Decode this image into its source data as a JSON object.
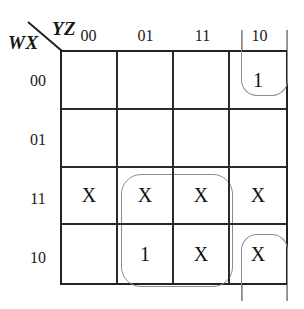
{
  "kmap": {
    "row_variable_label": "WX",
    "col_variable_label": "YZ",
    "col_headers": [
      "00",
      "01",
      "11",
      "10"
    ],
    "row_headers": [
      "00",
      "01",
      "11",
      "10"
    ],
    "cells": [
      [
        "",
        "",
        "",
        "1"
      ],
      [
        "",
        "",
        "",
        ""
      ],
      [
        "X",
        "X",
        "X",
        "X"
      ],
      [
        "",
        "1",
        "X",
        "X"
      ]
    ],
    "groups": [
      {
        "name": "center-2x2-group",
        "cells": "row11-row10 x col01-col11"
      },
      {
        "name": "top-right-wrap-group",
        "cells": "row00 x col10"
      },
      {
        "name": "bottom-right-wrap-group",
        "cells": "row10 x col10"
      }
    ],
    "colors": {
      "grid_line": "#2a2a2a",
      "group_line": "#8d8d8d",
      "text": "#111111"
    }
  }
}
